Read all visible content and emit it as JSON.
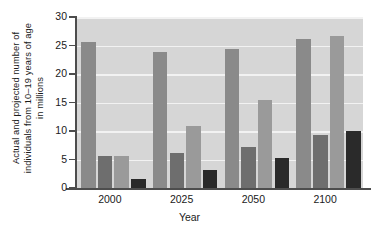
{
  "chart_data": {
    "type": "bar",
    "title": "",
    "xlabel": "Year",
    "ylabel": "Actual and projected number of individuals from 10–19 years of age in millions",
    "ylabel_lines": [
      "Actual and projected number of",
      "individuals from 10–19 years of age",
      "in millions"
    ],
    "categories": [
      "2000",
      "2025",
      "2050",
      "2100"
    ],
    "ylim": [
      0,
      30
    ],
    "yticks": [
      0,
      5,
      10,
      15,
      20,
      25,
      30
    ],
    "ytick_labels": [
      "0",
      "5",
      "10",
      "15",
      "20",
      "25",
      "30"
    ],
    "grid": true,
    "legend": "none",
    "series": [
      {
        "name": "series-1",
        "color": "#8a8a8a",
        "values": [
          25.7,
          23.9,
          24.4,
          26.1
        ]
      },
      {
        "name": "series-2",
        "color": "#6e6e6e",
        "values": [
          5.6,
          6.2,
          7.2,
          9.3
        ]
      },
      {
        "name": "series-3",
        "color": "#9a9a9a",
        "values": [
          5.6,
          10.9,
          15.5,
          26.6
        ]
      },
      {
        "name": "series-4",
        "color": "#2a2a2a",
        "values": [
          1.6,
          3.1,
          5.2,
          10.0
        ]
      }
    ],
    "bar_colors": {
      "series1": "#8a8a8a",
      "series2": "#6e6e6e",
      "series3": "#9a9a9a",
      "series4": "#2a2a2a"
    },
    "plot_background": "#d6d6d6",
    "gridline_color": "#f2f2f2",
    "axis_color": "#4d4d4d"
  }
}
